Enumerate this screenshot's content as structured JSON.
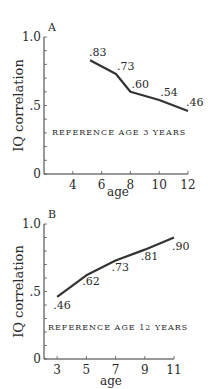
{
  "chart_data": [
    {
      "type": "line",
      "panel_label": "A",
      "title": "",
      "annotation": "REFERENCE AGE 3 YEARS",
      "xlabel": "age",
      "ylabel": "IQ correlation",
      "x_ticks": [
        4,
        6,
        8,
        10,
        12
      ],
      "y_tick_labels": [
        "0",
        ".5",
        "1.0"
      ],
      "xlim": [
        2,
        12
      ],
      "ylim": [
        0,
        1.0
      ],
      "grid": false,
      "series": [
        {
          "name": "Reference age 3 years",
          "x": [
            5.2,
            7,
            8,
            10,
            12
          ],
          "values": [
            0.83,
            0.73,
            0.6,
            0.54,
            0.46
          ],
          "labels": [
            ".83",
            ".73",
            ".60",
            ".54",
            ".46"
          ]
        }
      ]
    },
    {
      "type": "line",
      "panel_label": "B",
      "title": "",
      "annotation": "REFERENCE AGE 12 YEARS",
      "xlabel": "age",
      "ylabel": "IQ correlation",
      "x_ticks": [
        3,
        5,
        7,
        9,
        11
      ],
      "y_tick_labels": [
        "0",
        ".5",
        "1.0"
      ],
      "xlim": [
        2.1,
        11
      ],
      "ylim": [
        0,
        1.0
      ],
      "grid": false,
      "series": [
        {
          "name": "Reference age 12 years",
          "x": [
            3,
            5,
            7,
            9,
            11
          ],
          "values": [
            0.46,
            0.62,
            0.73,
            0.81,
            0.9
          ],
          "labels": [
            ".46",
            ".62",
            ".73",
            ".81",
            ".90"
          ]
        }
      ]
    }
  ]
}
